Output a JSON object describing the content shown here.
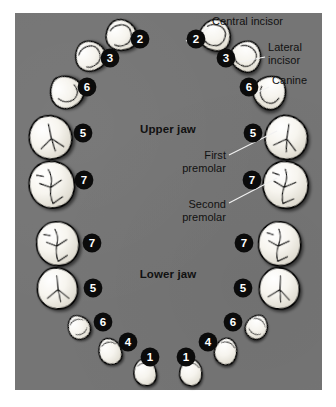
{
  "figure": {
    "name": "permanent-dentition-eruption-chart",
    "panel_color": "#757575",
    "tooth_fill": "#f4f2ec",
    "badge_color": "#0b0b0b",
    "badge_text_color": "#ffffff",
    "label_color": "#111111",
    "leader_color": "#f2f2f2"
  },
  "jaw_labels": {
    "upper": "Upper jaw",
    "lower": "Lower jaw"
  },
  "callouts": [
    {
      "id": "central-incisor",
      "lines": [
        "Central incisor"
      ],
      "x": 212,
      "y": 25,
      "anchor": "start"
    },
    {
      "id": "lateral-incisor",
      "lines": [
        "Lateral",
        "incisor"
      ],
      "x": 268,
      "y": 51,
      "anchor": "start"
    },
    {
      "id": "canine",
      "lines": [
        "Canine"
      ],
      "x": 272,
      "y": 84,
      "anchor": "start"
    },
    {
      "id": "first-premolar",
      "lines": [
        "First",
        "premolar"
      ],
      "x": 226,
      "y": 159,
      "anchor": "end"
    },
    {
      "id": "second-premolar",
      "lines": [
        "Second",
        "premolar"
      ],
      "x": 226,
      "y": 208,
      "anchor": "end"
    }
  ],
  "badges": {
    "upper_left": [
      {
        "num": "2",
        "x": 140,
        "y": 39
      },
      {
        "num": "3",
        "x": 110,
        "y": 58
      },
      {
        "num": "6",
        "x": 87,
        "y": 87
      },
      {
        "num": "5",
        "x": 83,
        "y": 133
      },
      {
        "num": "7",
        "x": 84,
        "y": 180
      }
    ],
    "upper_right": [
      {
        "num": "2",
        "x": 196,
        "y": 39
      },
      {
        "num": "3",
        "x": 226,
        "y": 58
      },
      {
        "num": "6",
        "x": 249,
        "y": 87
      },
      {
        "num": "5",
        "x": 253,
        "y": 133
      },
      {
        "num": "7",
        "x": 252,
        "y": 180
      }
    ],
    "lower_left": [
      {
        "num": "7",
        "x": 92,
        "y": 243
      },
      {
        "num": "5",
        "x": 93,
        "y": 288
      },
      {
        "num": "6",
        "x": 103,
        "y": 322
      },
      {
        "num": "4",
        "x": 128,
        "y": 342
      },
      {
        "num": "1",
        "x": 150,
        "y": 357
      }
    ],
    "lower_right": [
      {
        "num": "7",
        "x": 244,
        "y": 243
      },
      {
        "num": "5",
        "x": 243,
        "y": 288
      },
      {
        "num": "6",
        "x": 233,
        "y": 322
      },
      {
        "num": "4",
        "x": 208,
        "y": 342
      },
      {
        "num": "1",
        "x": 186,
        "y": 357
      }
    ]
  },
  "teeth": {
    "upper_left": [
      {
        "id": "ul-central-incisor",
        "type": "incisor",
        "cx": 121,
        "cy": 35,
        "rot": -14,
        "scale": 1.0
      },
      {
        "id": "ul-lateral-incisor",
        "type": "incisor",
        "cx": 90,
        "cy": 56,
        "rot": -30,
        "scale": 0.98
      },
      {
        "id": "ul-canine",
        "type": "canine",
        "cx": 66,
        "cy": 92,
        "rot": -38,
        "scale": 1.05
      },
      {
        "id": "ul-first-premolar",
        "type": "premolar",
        "cx": 50,
        "cy": 137,
        "rot": -10,
        "scale": 1.12
      },
      {
        "id": "ul-second-premolar",
        "type": "molar",
        "cx": 51,
        "cy": 184,
        "rot": -6,
        "scale": 1.12
      }
    ],
    "upper_right": [
      {
        "id": "ur-central-incisor",
        "type": "incisor",
        "cx": 215,
        "cy": 35,
        "rot": 14,
        "scale": 1.0
      },
      {
        "id": "ur-lateral-incisor",
        "type": "incisor",
        "cx": 246,
        "cy": 56,
        "rot": 30,
        "scale": 0.98
      },
      {
        "id": "ur-canine",
        "type": "canine",
        "cx": 270,
        "cy": 92,
        "rot": 38,
        "scale": 1.05
      },
      {
        "id": "ur-first-premolar",
        "type": "premolar",
        "cx": 286,
        "cy": 137,
        "rot": 10,
        "scale": 1.12
      },
      {
        "id": "ur-second-premolar",
        "type": "molar",
        "cx": 285,
        "cy": 184,
        "rot": 6,
        "scale": 1.12
      }
    ],
    "lower_left": [
      {
        "id": "ll-second-molar",
        "type": "molar",
        "cx": 57,
        "cy": 243,
        "rot": -4,
        "scale": 1.05
      },
      {
        "id": "ll-first-molar",
        "type": "premolar",
        "cx": 57,
        "cy": 288,
        "rot": -4,
        "scale": 1.06
      },
      {
        "id": "ll-canine",
        "type": "lowcanine",
        "cx": 79,
        "cy": 327,
        "rot": -28,
        "scale": 0.82
      },
      {
        "id": "ll-lateral-incisor",
        "type": "lowinc",
        "cx": 110,
        "cy": 351,
        "rot": -16,
        "scale": 0.86
      },
      {
        "id": "ll-central-incisor",
        "type": "lowinc",
        "cx": 145,
        "cy": 372,
        "rot": -6,
        "scale": 0.86
      }
    ],
    "lower_right": [
      {
        "id": "lr-second-molar",
        "type": "molar",
        "cx": 279,
        "cy": 243,
        "rot": 4,
        "scale": 1.05
      },
      {
        "id": "lr-first-molar",
        "type": "premolar",
        "cx": 279,
        "cy": 288,
        "rot": 4,
        "scale": 1.06
      },
      {
        "id": "lr-canine",
        "type": "lowcanine",
        "cx": 257,
        "cy": 327,
        "rot": 28,
        "scale": 0.82
      },
      {
        "id": "lr-lateral-incisor",
        "type": "lowinc",
        "cx": 226,
        "cy": 351,
        "rot": 16,
        "scale": 0.86
      },
      {
        "id": "lr-central-incisor",
        "type": "lowinc",
        "cx": 191,
        "cy": 372,
        "rot": 6,
        "scale": 0.86
      }
    ]
  },
  "leaders": [
    {
      "id": "leader-central-incisor",
      "d": "M209,28 L186,41"
    },
    {
      "id": "leader-lateral-incisor",
      "d": "M265,57 L240,62"
    },
    {
      "id": "leader-canine",
      "d": "M269,87 L256,93"
    },
    {
      "id": "leader-first-premolar",
      "d": "M229,155 L277,131"
    },
    {
      "id": "leader-second-premolar",
      "d": "M229,203 L277,178"
    }
  ]
}
